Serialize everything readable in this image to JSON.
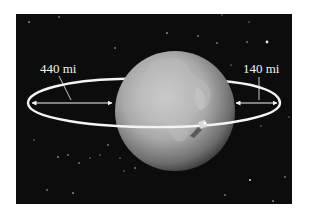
{
  "diagram": {
    "background_color": "#0c0c0c",
    "orbit_color": "#f4f4f4",
    "labels": {
      "left_distance": "440 mi",
      "right_distance": "140 mi"
    },
    "elements": [
      "space-background",
      "stars",
      "earth",
      "elliptical-orbit",
      "satellite",
      "distance-arrow-left",
      "distance-arrow-right"
    ]
  }
}
